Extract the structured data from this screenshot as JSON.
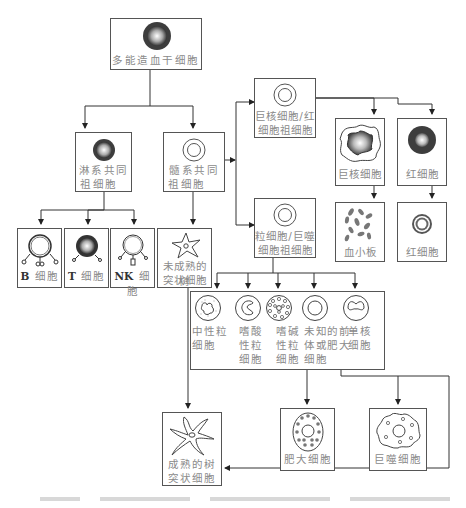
{
  "diagram": {
    "type": "hematopoiesis-lineage-tree",
    "nodes": {
      "hsc": {
        "label": "多能造血干细胞"
      },
      "lymphoid_progenitor": {
        "label_l1": "淋系共同",
        "label_l2": "祖细胞"
      },
      "myeloid_progenitor": {
        "label_l1": "髓系共同",
        "label_l2": "祖细胞"
      },
      "mk_erythroid_progenitor": {
        "label_l1": "巨核细胞/红",
        "label_l2": "细胞祖细胞"
      },
      "gm_progenitor": {
        "label_l1": "粒细胞/巨噬",
        "label_l2": "细胞祖细胞"
      },
      "megakaryocyte": {
        "label": "巨核细胞"
      },
      "erythroblast": {
        "label": "红细胞"
      },
      "platelets": {
        "label": "血小板"
      },
      "erythrocyte": {
        "label": "红细胞"
      },
      "b_cell": {
        "prefix": "B",
        "label": "细胞"
      },
      "t_cell": {
        "prefix": "T",
        "label": "细胞"
      },
      "nk_cell": {
        "prefix": "NK",
        "label": "细胞"
      },
      "immature_dc": {
        "label_l1": "未成熟的树",
        "label_l2": "突状细胞"
      },
      "neutrophil": {
        "label_l1": "中性粒",
        "label_l2": "细胞"
      },
      "eosinophil": {
        "label_l1": "嗜酸",
        "label_l2": "性粒",
        "label_l3": "细胞"
      },
      "basophil": {
        "label_l1": "嗜碱",
        "label_l2": "性粒",
        "label_l3": "细胞"
      },
      "unknown_precursor": {
        "label_l1": "未知的前",
        "label_l2": "体或肥大",
        "label_l3": "细胞"
      },
      "monocyte": {
        "label_l1": "单核",
        "label_l2": "细胞"
      },
      "mast_cell": {
        "label": "肥大细胞"
      },
      "macrophage": {
        "label": "巨噬细胞"
      },
      "mature_dc": {
        "label_l1": "成熟的树",
        "label_l2": "突状细胞"
      }
    },
    "edges": [
      [
        "hsc",
        "lymphoid_progenitor"
      ],
      [
        "hsc",
        "myeloid_progenitor"
      ],
      [
        "myeloid_progenitor",
        "mk_erythroid_progenitor"
      ],
      [
        "myeloid_progenitor",
        "gm_progenitor"
      ],
      [
        "myeloid_progenitor",
        "immature_dc"
      ],
      [
        "mk_erythroid_progenitor",
        "megakaryocyte"
      ],
      [
        "mk_erythroid_progenitor",
        "erythroblast"
      ],
      [
        "megakaryocyte",
        "platelets"
      ],
      [
        "erythroblast",
        "erythrocyte"
      ],
      [
        "lymphoid_progenitor",
        "b_cell"
      ],
      [
        "lymphoid_progenitor",
        "t_cell"
      ],
      [
        "lymphoid_progenitor",
        "nk_cell"
      ],
      [
        "gm_progenitor",
        "neutrophil"
      ],
      [
        "gm_progenitor",
        "eosinophil"
      ],
      [
        "gm_progenitor",
        "basophil"
      ],
      [
        "gm_progenitor",
        "unknown_precursor"
      ],
      [
        "gm_progenitor",
        "monocyte"
      ],
      [
        "unknown_precursor",
        "mast_cell"
      ],
      [
        "monocyte",
        "macrophage"
      ],
      [
        "immature_dc",
        "mature_dc"
      ],
      [
        "monocyte",
        "mature_dc"
      ]
    ],
    "colors": {
      "border": "#555555",
      "label": "#8a8a8a",
      "dark_cell": "#3a3a3a"
    }
  }
}
